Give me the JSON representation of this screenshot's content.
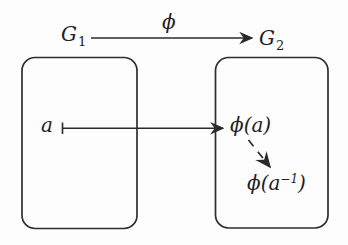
{
  "figure": {
    "colors": {
      "ink": "#2a2a2a",
      "background": "#fdfdfd"
    },
    "homomorphism": {
      "domain_group": {
        "base": "G",
        "sub": "1"
      },
      "map_label": "ϕ",
      "codomain_group": {
        "base": "G",
        "sub": "2"
      }
    },
    "element": "a",
    "image_of_element": "ϕ(a)",
    "image_of_inverse": {
      "pre": "ϕ(a",
      "sup": "−1",
      "post": ")"
    }
  }
}
